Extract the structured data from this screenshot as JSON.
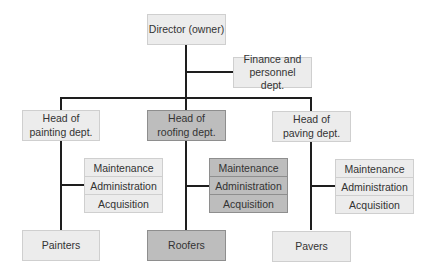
{
  "diagram": {
    "root": {
      "label": "Director (owner)"
    },
    "staff": {
      "label": "Finance and personnel dept."
    },
    "departments": [
      {
        "head": "Head of painting dept.",
        "functions": [
          "Maintenance",
          "Administration",
          "Acquisition"
        ],
        "workers": "Painters",
        "highlighted": false
      },
      {
        "head": "Head of roofing dept.",
        "functions": [
          "Maintenance",
          "Administration",
          "Acquisition"
        ],
        "workers": "Roofers",
        "highlighted": true
      },
      {
        "head": "Head of paving dept.",
        "functions": [
          "Maintenance",
          "Administration",
          "Acquisition"
        ],
        "workers": "Pavers",
        "highlighted": false
      }
    ]
  },
  "colors": {
    "light_fill": "#ececec",
    "dark_fill": "#bdbdbd",
    "line": "#1e1e1e"
  }
}
